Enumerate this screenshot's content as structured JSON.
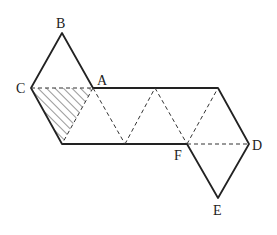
{
  "diagram": {
    "type": "net of triangles (hexagonal/parallelogram figure)",
    "labels": {
      "A": "A",
      "B": "B",
      "C": "C",
      "D": "D",
      "E": "E",
      "F": "F"
    },
    "points": {
      "B": [
        62,
        33
      ],
      "C": [
        31,
        88
      ],
      "A": [
        93,
        88
      ],
      "P": [
        62,
        144
      ],
      "Q": [
        125,
        144
      ],
      "F": [
        187,
        144
      ],
      "R": [
        155,
        88
      ],
      "S": [
        218,
        88
      ],
      "D": [
        249,
        144
      ],
      "E": [
        218,
        198
      ]
    },
    "shaded_region": "triangle C-A-P (hatched)",
    "colors": {
      "line": "#222222",
      "hatch": "#333333",
      "background": "#ffffff"
    }
  }
}
